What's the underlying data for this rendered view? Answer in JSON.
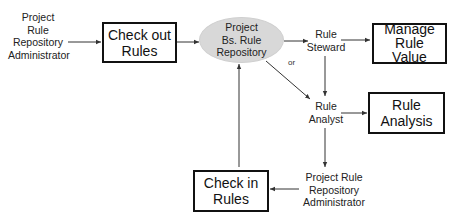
{
  "diagram": {
    "actors": {
      "admin_top": [
        "Project",
        "Rule",
        "Repository",
        "Administrator"
      ],
      "rule_steward": [
        "Rule",
        "Steward"
      ],
      "rule_analyst": [
        "Rule",
        "Analyst"
      ],
      "admin_bottom": [
        "Project Rule",
        "Repository",
        "Administrator"
      ]
    },
    "boxes": {
      "check_out": [
        "Check out",
        "Rules"
      ],
      "manage_value": [
        "Manage",
        "Rule",
        "Value"
      ],
      "rule_analysis": [
        "Rule",
        "Analysis"
      ],
      "check_in": [
        "Check in",
        "Rules"
      ]
    },
    "repository": [
      "Project",
      "Bs. Rule",
      "Repository"
    ],
    "or_label": "or",
    "colors": {
      "ellipse_fill": "#d8d8d8",
      "box_border": "#111111",
      "line": "#333333"
    }
  }
}
